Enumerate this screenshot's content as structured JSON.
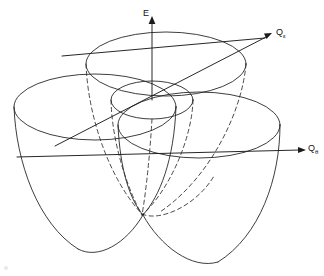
{
  "figure": {
    "background_color": "#ffffff",
    "line_color": "#1b1b1b",
    "dashed_line_color": "#2a2a2a",
    "width": 324,
    "height": 276,
    "axes": [
      {
        "id": "energy",
        "label": "E",
        "subscript": "",
        "label_x": 146,
        "label_y": 14,
        "from": [
          152,
          100
        ],
        "to": [
          152,
          20
        ],
        "arrow": "up"
      },
      {
        "id": "q-epsilon",
        "label": "Q",
        "subscript": "ε",
        "label_x": 276,
        "label_y": 34,
        "from": [
          62,
          56
        ],
        "to": [
          268,
          38
        ],
        "arrow": "up-right"
      },
      {
        "id": "q-theta",
        "label": "Q",
        "subscript": "θ",
        "label_x": 312,
        "label_y": 150,
        "from": [
          17,
          157
        ],
        "to": [
          304,
          152
        ],
        "arrow": "down-right"
      }
    ],
    "lobes": [
      {
        "id": "back-lobe",
        "center_x": 166,
        "center_y": 64,
        "rx": 80,
        "ry": 32,
        "depth": 148
      },
      {
        "id": "left-lobe",
        "center_x": 95,
        "center_y": 107,
        "rx": 81,
        "ry": 33,
        "depth": 150
      },
      {
        "id": "right-lobe",
        "center_x": 199,
        "center_y": 125,
        "rx": 81,
        "ry": 33,
        "depth": 148
      }
    ],
    "central_circle": {
      "id": "trough-minimum-ring",
      "center_x": 152,
      "center_y": 100,
      "rx": 41,
      "ry": 19
    },
    "conical_intersection": {
      "x": 142,
      "y": 215
    }
  }
}
